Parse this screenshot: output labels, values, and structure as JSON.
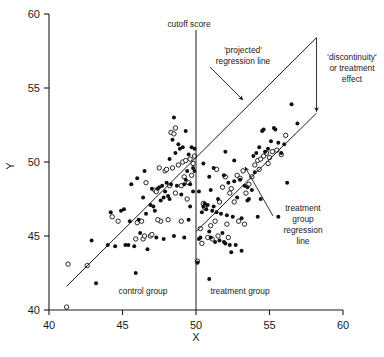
{
  "chart_data": {
    "type": "scatter",
    "title": "",
    "xlabel": "X",
    "ylabel": "Y",
    "xlim": [
      40,
      60
    ],
    "ylim": [
      40,
      60
    ],
    "xticks": [
      40,
      45,
      50,
      55,
      60
    ],
    "yticks": [
      40,
      45,
      50,
      55,
      60
    ],
    "grid": false,
    "legend_position": "none",
    "cutoff": {
      "x": 50,
      "label": "cutoff score"
    },
    "group_labels": {
      "control": "control group",
      "treatment": "treatment group"
    },
    "annotations": [
      {
        "name": "projected-regression-line",
        "lines": [
          "'projected'",
          "regression line"
        ]
      },
      {
        "name": "discontinuity-effect",
        "lines": [
          "'discontinuity'",
          "or treatment",
          "effect"
        ]
      },
      {
        "name": "treatment-group-regression-line",
        "lines": [
          "treatment",
          "group",
          "regression",
          "line"
        ]
      }
    ],
    "lines": [
      {
        "name": "control-regression-line",
        "x": [
          41.2,
          50.0
        ],
        "y": [
          41.6,
          50.3
        ],
        "style": "solid"
      },
      {
        "name": "projected-regression-line",
        "x": [
          50.0,
          58.2
        ],
        "y": [
          50.3,
          58.4
        ],
        "style": "solid"
      },
      {
        "name": "treatment-group-regression-line",
        "x": [
          50.0,
          58.2
        ],
        "y": [
          45.3,
          53.3
        ],
        "style": "solid"
      }
    ],
    "effect_arrow": {
      "name": "discontinuity-arrow",
      "x": 58.2,
      "y_from": 58.4,
      "y_to": 53.4
    },
    "series": [
      {
        "name": "control group (open)",
        "marker": "open-circle",
        "points": [
          [
            41.3,
            43.1
          ],
          [
            41.2,
            40.2
          ],
          [
            42.6,
            43.0
          ],
          [
            44.3,
            46.3
          ],
          [
            44.7,
            46.0
          ],
          [
            46.0,
            45.9
          ],
          [
            46.3,
            46.0
          ],
          [
            46.4,
            44.8
          ],
          [
            46.5,
            45.0
          ],
          [
            46.9,
            45.0
          ],
          [
            47.0,
            45.1
          ],
          [
            47.2,
            48.1
          ],
          [
            47.3,
            48.0
          ],
          [
            47.5,
            49.6
          ],
          [
            47.6,
            46.0
          ],
          [
            47.9,
            49.4
          ],
          [
            48.0,
            49.5
          ],
          [
            48.2,
            48.4
          ],
          [
            48.3,
            52.0
          ],
          [
            48.4,
            49.6
          ],
          [
            48.5,
            51.9
          ],
          [
            48.6,
            52.3
          ],
          [
            48.6,
            47.9
          ],
          [
            48.8,
            49.8
          ],
          [
            49.0,
            48.4
          ],
          [
            49.1,
            50.0
          ],
          [
            49.2,
            49.0
          ],
          [
            49.3,
            50.1
          ],
          [
            49.4,
            47.5
          ],
          [
            49.5,
            48.6
          ],
          [
            49.6,
            50.2
          ],
          [
            49.7,
            49.1
          ],
          [
            49.8,
            49.9
          ],
          [
            49.9,
            50.4
          ],
          [
            46.6,
            48.6
          ],
          [
            47.4,
            46.1
          ],
          [
            48.1,
            46.1
          ],
          [
            49.0,
            46.0
          ],
          [
            45.9,
            44.8
          ]
        ]
      },
      {
        "name": "control group (filled)",
        "marker": "filled-circle",
        "points": [
          [
            42.9,
            44.7
          ],
          [
            43.2,
            41.8
          ],
          [
            44.0,
            44.4
          ],
          [
            44.2,
            46.6
          ],
          [
            44.5,
            44.3
          ],
          [
            44.9,
            46.7
          ],
          [
            45.1,
            46.8
          ],
          [
            45.2,
            44.4
          ],
          [
            45.5,
            46.0
          ],
          [
            45.6,
            48.5
          ],
          [
            45.8,
            44.3
          ],
          [
            45.9,
            42.5
          ],
          [
            46.0,
            48.9
          ],
          [
            46.1,
            46.1
          ],
          [
            46.2,
            45.2
          ],
          [
            46.4,
            47.6
          ],
          [
            46.5,
            49.4
          ],
          [
            46.6,
            46.5
          ],
          [
            46.7,
            44.1
          ],
          [
            46.9,
            47.1
          ],
          [
            47.0,
            48.2
          ],
          [
            47.1,
            47.0
          ],
          [
            47.2,
            46.7
          ],
          [
            47.3,
            44.9
          ],
          [
            47.4,
            48.2
          ],
          [
            47.5,
            48.3
          ],
          [
            47.6,
            47.4
          ],
          [
            47.7,
            48.4
          ],
          [
            47.8,
            47.6
          ],
          [
            47.9,
            48.0
          ],
          [
            48.0,
            48.6
          ],
          [
            48.1,
            47.7
          ],
          [
            48.2,
            47.5
          ],
          [
            48.3,
            48.5
          ],
          [
            48.4,
            51.5
          ],
          [
            48.5,
            53.0
          ],
          [
            48.6,
            50.6
          ],
          [
            48.7,
            48.4
          ],
          [
            48.8,
            51.2
          ],
          [
            48.9,
            50.9
          ],
          [
            49.0,
            47.8
          ],
          [
            49.1,
            51.0
          ],
          [
            49.2,
            48.5
          ],
          [
            49.3,
            48.8
          ],
          [
            49.4,
            49.4
          ],
          [
            49.5,
            50.5
          ],
          [
            49.6,
            48.5
          ],
          [
            49.7,
            51.0
          ],
          [
            49.8,
            49.6
          ],
          [
            49.9,
            49.4
          ],
          [
            49.5,
            46.1
          ],
          [
            48.5,
            45.0
          ],
          [
            49.2,
            44.9
          ],
          [
            47.8,
            44.8
          ],
          [
            45.4,
            44.4
          ],
          [
            49.6,
            47.0
          ],
          [
            49.8,
            48.0
          ],
          [
            49.3,
            52.1
          ],
          [
            48.2,
            50.2
          ],
          [
            49.9,
            50.9
          ]
        ]
      },
      {
        "name": "treatment group (open)",
        "marker": "open-circle",
        "points": [
          [
            50.1,
            43.3
          ],
          [
            50.3,
            45.5
          ],
          [
            50.5,
            47.2
          ],
          [
            50.6,
            46.9
          ],
          [
            50.8,
            44.9
          ],
          [
            51.0,
            45.7
          ],
          [
            51.1,
            44.8
          ],
          [
            51.3,
            46.0
          ],
          [
            51.5,
            45.0
          ],
          [
            51.6,
            47.3
          ],
          [
            51.8,
            48.3
          ],
          [
            52.0,
            49.0
          ],
          [
            52.1,
            45.8
          ],
          [
            52.3,
            47.9
          ],
          [
            52.4,
            48.2
          ],
          [
            52.6,
            47.3
          ],
          [
            52.8,
            49.1
          ],
          [
            53.0,
            48.9
          ],
          [
            53.2,
            49.4
          ],
          [
            53.4,
            47.9
          ],
          [
            53.6,
            48.5
          ],
          [
            53.8,
            49.0
          ],
          [
            54.0,
            49.8
          ],
          [
            54.2,
            50.1
          ],
          [
            54.4,
            50.2
          ],
          [
            54.6,
            50.4
          ],
          [
            54.8,
            50.6
          ],
          [
            55.0,
            50.3
          ],
          [
            55.2,
            50.7
          ],
          [
            55.5,
            50.8
          ],
          [
            56.1,
            51.8
          ],
          [
            52.9,
            46.0
          ],
          [
            51.4,
            49.5
          ],
          [
            50.4,
            44.5
          ],
          [
            52.2,
            44.9
          ],
          [
            53.3,
            45.8
          ],
          [
            54.9,
            49.9
          ],
          [
            54.3,
            49.5
          ],
          [
            55.8,
            50.5
          ]
        ]
      },
      {
        "name": "treatment group (filled)",
        "marker": "filled-circle",
        "points": [
          [
            50.1,
            43.2
          ],
          [
            50.2,
            44.8
          ],
          [
            50.3,
            44.9
          ],
          [
            50.4,
            46.6
          ],
          [
            50.5,
            47.0
          ],
          [
            50.6,
            47.2
          ],
          [
            50.7,
            46.8
          ],
          [
            50.8,
            47.1
          ],
          [
            50.9,
            45.3
          ],
          [
            51.0,
            44.9
          ],
          [
            51.1,
            46.7
          ],
          [
            51.2,
            47.0
          ],
          [
            51.3,
            44.6
          ],
          [
            51.4,
            46.6
          ],
          [
            51.5,
            47.5
          ],
          [
            51.6,
            44.7
          ],
          [
            51.7,
            46.5
          ],
          [
            51.8,
            45.2
          ],
          [
            51.9,
            44.6
          ],
          [
            52.0,
            44.5
          ],
          [
            52.1,
            46.4
          ],
          [
            52.2,
            48.6
          ],
          [
            52.3,
            44.4
          ],
          [
            52.4,
            43.9
          ],
          [
            52.5,
            46.3
          ],
          [
            52.6,
            48.7
          ],
          [
            52.7,
            44.4
          ],
          [
            52.8,
            47.6
          ],
          [
            53.0,
            48.8
          ],
          [
            53.1,
            46.2
          ],
          [
            53.3,
            48.4
          ],
          [
            53.5,
            48.3
          ],
          [
            53.6,
            47.5
          ],
          [
            53.8,
            48.1
          ],
          [
            54.0,
            49.3
          ],
          [
            54.1,
            50.6
          ],
          [
            54.3,
            51.0
          ],
          [
            54.5,
            52.1
          ],
          [
            54.6,
            52.2
          ],
          [
            54.7,
            50.7
          ],
          [
            54.9,
            50.9
          ],
          [
            55.1,
            51.4
          ],
          [
            55.3,
            52.3
          ],
          [
            55.4,
            52.2
          ],
          [
            55.6,
            51.3
          ],
          [
            55.8,
            50.6
          ],
          [
            56.0,
            51.2
          ],
          [
            56.2,
            48.6
          ],
          [
            56.5,
            53.9
          ],
          [
            56.9,
            52.6
          ],
          [
            55.6,
            46.3
          ],
          [
            54.2,
            46.3
          ],
          [
            53.5,
            47.4
          ],
          [
            52.0,
            50.7
          ],
          [
            50.9,
            42.1
          ],
          [
            51.2,
            49.6
          ],
          [
            50.5,
            49.9
          ],
          [
            50.9,
            49.0
          ],
          [
            52.6,
            50.1
          ],
          [
            53.9,
            50.4
          ],
          [
            50.2,
            48.0
          ],
          [
            51.0,
            48.1
          ],
          [
            51.9,
            49.1
          ],
          [
            53.1,
            44.0
          ],
          [
            54.4,
            47.5
          ]
        ]
      }
    ]
  }
}
